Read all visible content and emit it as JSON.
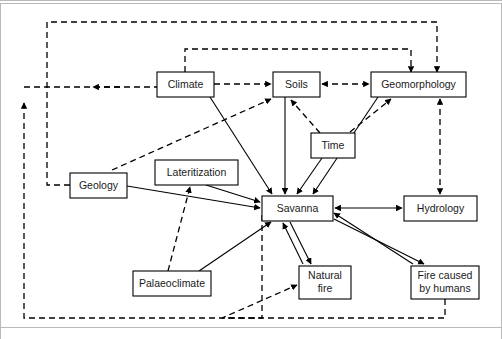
{
  "figure": {
    "background_color": "#ffffff",
    "line_color": "#000000",
    "box_fill": "#ffffff",
    "frame_color": "#b9b9b9"
  },
  "nodes": [
    {
      "id": "climate",
      "label": "Climate",
      "x": 157,
      "y": 72,
      "w": 57,
      "h": 25
    },
    {
      "id": "soils",
      "label": "Soils",
      "x": 273,
      "y": 72,
      "w": 47,
      "h": 25
    },
    {
      "id": "geomorphology",
      "label": "Geomorphology",
      "x": 371,
      "y": 72,
      "w": 95,
      "h": 25
    },
    {
      "id": "time",
      "label": "Time",
      "x": 311,
      "y": 133,
      "w": 44,
      "h": 25
    },
    {
      "id": "geology",
      "label": "Geology",
      "x": 70,
      "y": 173,
      "w": 57,
      "h": 25
    },
    {
      "id": "lateritization",
      "label": "Lateritization",
      "x": 155,
      "y": 160,
      "w": 83,
      "h": 25
    },
    {
      "id": "savanna",
      "label": "Savanna",
      "x": 262,
      "y": 196,
      "w": 71,
      "h": 25
    },
    {
      "id": "hydrology",
      "label": "Hydrology",
      "x": 404,
      "y": 196,
      "w": 73,
      "h": 25
    },
    {
      "id": "palaeoclimate",
      "label": "Palaeoclimate",
      "x": 133,
      "y": 271,
      "w": 78,
      "h": 25
    },
    {
      "id": "natural_fire",
      "label": "Natural\nfire",
      "x": 299,
      "y": 266,
      "w": 52,
      "h": 33,
      "lines": [
        "Natural",
        "fire"
      ]
    },
    {
      "id": "fire_humans",
      "label": "Fire caused\nby humans",
      "x": 411,
      "y": 266,
      "w": 68,
      "h": 33,
      "lines": [
        "Fire caused",
        "by humans"
      ]
    }
  ],
  "edges": [
    {
      "id": "climate-to-soils",
      "from": "Climate",
      "to": "Soils",
      "style": "dashed",
      "arrows": "one-way"
    },
    {
      "id": "soils-to-geomorphology",
      "from": "Soils",
      "to": "Geomorphology",
      "style": "dashed",
      "arrows": "two-way"
    },
    {
      "id": "climate-to-geomorphology",
      "from": "Climate",
      "to": "Geomorphology",
      "style": "dashed",
      "arrows": "one-way"
    },
    {
      "id": "geology-to-geomorphology",
      "from": "Geology",
      "to": "Geomorphology",
      "style": "dashed",
      "arrows": "one-way"
    },
    {
      "id": "geology-to-soils",
      "from": "Geology",
      "to": "Soils",
      "style": "dashed",
      "arrows": "one-way"
    },
    {
      "id": "savanna-to-climate",
      "from": "Savanna",
      "to": "Climate",
      "style": "dashed",
      "arrows": "one-way"
    },
    {
      "id": "savanna-to-geology",
      "from": "Savanna",
      "to": "Geology",
      "style": "dashed",
      "arrows": "one-way"
    },
    {
      "id": "time-to-soils",
      "from": "Time",
      "to": "Soils",
      "style": "dashed",
      "arrows": "one-way"
    },
    {
      "id": "time-to-geomorphology",
      "from": "Time",
      "to": "Geomorphology",
      "style": "dashed",
      "arrows": "one-way"
    },
    {
      "id": "geomorphology-to-hydrology",
      "from": "Geomorphology",
      "to": "Hydrology",
      "style": "dashed",
      "arrows": "two-way"
    },
    {
      "id": "palaeoclimate-to-lateritization",
      "from": "Palaeoclimate",
      "to": "Lateritization",
      "style": "dashed",
      "arrows": "one-way"
    },
    {
      "id": "fire-humans-to-natural-fire",
      "from": "Fire caused by humans",
      "to": "Natural fire",
      "style": "dashed",
      "arrows": "one-way"
    },
    {
      "id": "climate-to-savanna",
      "from": "Climate",
      "to": "Savanna",
      "style": "solid",
      "arrows": "one-way"
    },
    {
      "id": "soils-to-savanna",
      "from": "Soils",
      "to": "Savanna",
      "style": "solid",
      "arrows": "one-way"
    },
    {
      "id": "time-to-savanna",
      "from": "Time",
      "to": "Savanna",
      "style": "solid",
      "arrows": "one-way"
    },
    {
      "id": "geomorphology-to-savanna",
      "from": "Geomorphology",
      "to": "Savanna",
      "style": "solid",
      "arrows": "one-way"
    },
    {
      "id": "geology-to-savanna",
      "from": "Geology",
      "to": "Savanna",
      "style": "solid",
      "arrows": "one-way"
    },
    {
      "id": "lateritization-to-savanna",
      "from": "Lateritization",
      "to": "Savanna",
      "style": "solid",
      "arrows": "one-way"
    },
    {
      "id": "palaeoclimate-to-savanna",
      "from": "Palaeoclimate",
      "to": "Savanna",
      "style": "solid",
      "arrows": "one-way"
    },
    {
      "id": "savanna-to-hydrology",
      "from": "Savanna",
      "to": "Hydrology",
      "style": "solid",
      "arrows": "two-way"
    },
    {
      "id": "savanna-to-natural-fire",
      "from": "Savanna",
      "to": "Natural fire",
      "style": "solid",
      "arrows": "one-way"
    },
    {
      "id": "natural-fire-to-savanna",
      "from": "Natural fire",
      "to": "Savanna",
      "style": "solid",
      "arrows": "one-way"
    },
    {
      "id": "savanna-to-fire-humans",
      "from": "Savanna",
      "to": "Fire caused by humans",
      "style": "solid",
      "arrows": "one-way"
    },
    {
      "id": "fire-humans-to-savanna",
      "from": "Fire caused by humans",
      "to": "Savanna",
      "style": "solid",
      "arrows": "one-way"
    }
  ],
  "legend": {
    "solid_meaning": "direct influence",
    "dashed_meaning": "feedback / indirect influence"
  }
}
